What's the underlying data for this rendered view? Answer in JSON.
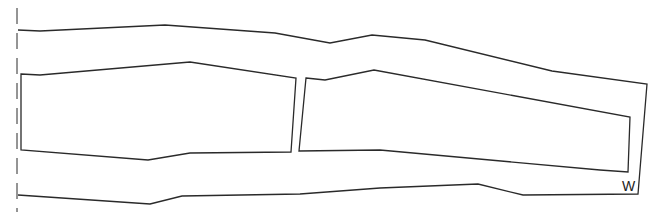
{
  "diagram": {
    "type": "floor-plan-outline",
    "stroke_color": "#2a2a2a",
    "background": "#ffffff",
    "boundary_dashed_line": {
      "x": 17,
      "y1": 8,
      "y2": 212
    },
    "outer_outline": [
      [
        18,
        30
      ],
      [
        40,
        31
      ],
      [
        165,
        25
      ],
      [
        275,
        33
      ],
      [
        330,
        43
      ],
      [
        372,
        35
      ],
      [
        425,
        40
      ],
      [
        552,
        71
      ],
      [
        647,
        84
      ],
      [
        638,
        194
      ],
      [
        523,
        195
      ],
      [
        478,
        184
      ],
      [
        380,
        188
      ],
      [
        300,
        194
      ],
      [
        182,
        196
      ],
      [
        150,
        204
      ],
      [
        18,
        195
      ]
    ],
    "regions": [
      {
        "name": "left-block",
        "points": [
          [
            21,
            74
          ],
          [
            40,
            75
          ],
          [
            190,
            62
          ],
          [
            296,
            78
          ],
          [
            291,
            152
          ],
          [
            190,
            153
          ],
          [
            148,
            160
          ],
          [
            21,
            150
          ]
        ]
      },
      {
        "name": "right-block",
        "points": [
          [
            306,
            78
          ],
          [
            325,
            80
          ],
          [
            374,
            70
          ],
          [
            630,
            117
          ],
          [
            628,
            172
          ],
          [
            600,
            170
          ],
          [
            380,
            150
          ],
          [
            299,
            151
          ]
        ]
      }
    ],
    "labels": [
      {
        "text": "W",
        "x": 622,
        "y": 179
      }
    ]
  }
}
